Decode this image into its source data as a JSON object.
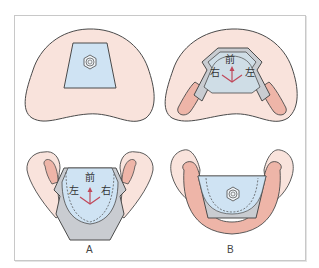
{
  "figure": {
    "panels": [
      {
        "id": "A",
        "label": "A",
        "top_view": "maxillary plate with screw",
        "bottom_view": "mandibular appliance with direction labels",
        "direction_labels": {
          "front": "前",
          "left": "左",
          "right": "右"
        }
      },
      {
        "id": "B",
        "label": "B",
        "top_view": "maxillary plate with direction labels",
        "bottom_view": "mandibular appliance with screw",
        "direction_labels": {
          "front": "前",
          "left": "左",
          "right": "右"
        }
      }
    ],
    "colors": {
      "tissue": "#f9e3dc",
      "gingiva_pink": "#eeb5a8",
      "plate_blue": "#cfe3f3",
      "plate_gray": "#c9ccd1",
      "outline": "#4a4a4a",
      "arrow_red": "#c0485a",
      "frame": "#c8c8c8"
    }
  },
  "labels": {
    "A": "A",
    "B": "B",
    "top_right": {
      "front": "前",
      "right": "右",
      "left": "左"
    },
    "bottom_left": {
      "front": "前",
      "left": "左",
      "right": "右"
    }
  }
}
